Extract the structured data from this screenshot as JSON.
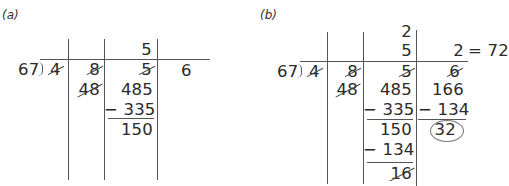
{
  "panels": {
    "a": {
      "label": "(a)",
      "divisor": "67",
      "quotient": {
        "col3": "5"
      },
      "dividend_digits": [
        "4",
        "8",
        "5",
        "6"
      ],
      "struck": [
        "4",
        "8",
        "5"
      ],
      "partial": "48",
      "work": {
        "minuend": "485",
        "subtrahend": "− 335",
        "remainder": "150"
      }
    },
    "b": {
      "label": "(b)",
      "divisor": "67",
      "quotient": {
        "col3_top": "2",
        "col3": "5",
        "col4": "2",
        "result": "= 72"
      },
      "dividend_digits": [
        "4",
        "8",
        "5",
        "6"
      ],
      "struck": [
        "4",
        "8",
        "5",
        "6"
      ],
      "partial": "48",
      "work_col3": {
        "minuend": "485",
        "subtrahend": "− 335",
        "remainder": "150",
        "subtrahend2": "− 134",
        "remainder2": "16"
      },
      "work_col4": {
        "minuend": "166",
        "subtrahend": "− 134",
        "remainder": "32"
      }
    }
  }
}
